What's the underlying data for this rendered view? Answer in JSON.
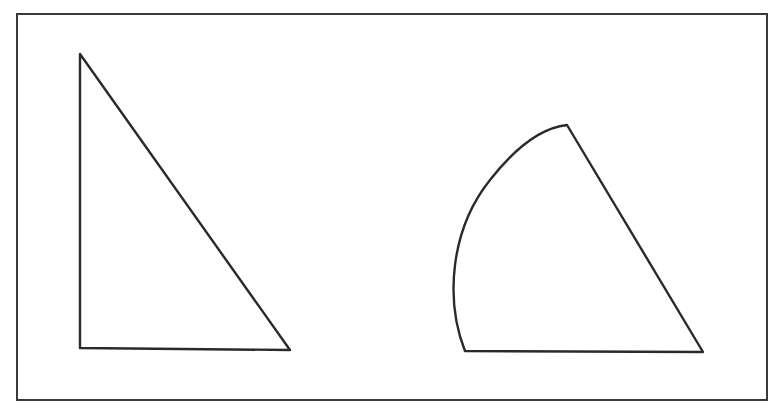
{
  "diagram": {
    "figures": [
      {
        "id": "triangle",
        "kind": "right triangle",
        "label": ""
      },
      {
        "id": "sector",
        "kind": "circular sector (curved side on left)",
        "label": ""
      }
    ],
    "colors": {
      "stroke": "#2a2a2a",
      "frame": "#3a3a3a",
      "background": "#ffffff"
    }
  }
}
